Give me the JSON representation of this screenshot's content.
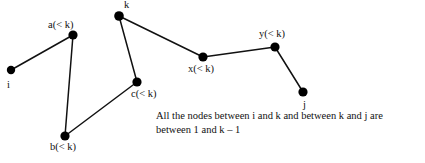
{
  "figure": {
    "background_color": "#ffffff",
    "stroke_color": "#111111",
    "node_fill_color": "#000000",
    "width": 425,
    "height": 163
  },
  "nodes": [
    {
      "id": "i",
      "label": "i",
      "x": 11,
      "y": 70,
      "label_x": 7,
      "label_y": 80,
      "r": 4.2
    },
    {
      "id": "a",
      "label": "a(< k)",
      "x": 73,
      "y": 35,
      "label_x": 48,
      "label_y": 20,
      "r": 4.6
    },
    {
      "id": "b",
      "label": "b(< k)",
      "x": 65,
      "y": 136,
      "label_x": 50,
      "label_y": 142,
      "r": 4.6
    },
    {
      "id": "c",
      "label": "c(< k)",
      "x": 137,
      "y": 82,
      "label_x": 131,
      "label_y": 89,
      "r": 4.6
    },
    {
      "id": "k",
      "label": "k",
      "x": 119,
      "y": 16,
      "label_x": 124,
      "label_y": 0,
      "r": 4.8
    },
    {
      "id": "x",
      "label": "x(< k)",
      "x": 203,
      "y": 57,
      "label_x": 188,
      "label_y": 64,
      "r": 4.6
    },
    {
      "id": "y",
      "label": "y(< k)",
      "x": 275,
      "y": 47,
      "label_x": 259,
      "label_y": 29,
      "r": 4.6
    },
    {
      "id": "j",
      "label": "j",
      "x": 303,
      "y": 92,
      "label_x": 303,
      "label_y": 100,
      "r": 4.6
    }
  ],
  "edges": [
    {
      "from": "i",
      "to": "a"
    },
    {
      "from": "a",
      "to": "b"
    },
    {
      "from": "b",
      "to": "c"
    },
    {
      "from": "c",
      "to": "k"
    },
    {
      "from": "k",
      "to": "x"
    },
    {
      "from": "x",
      "to": "y"
    },
    {
      "from": "y",
      "to": "j"
    }
  ],
  "caption": {
    "line1": "All the nodes between i and k and between k and j are",
    "line2": "between 1 and k – 1"
  }
}
